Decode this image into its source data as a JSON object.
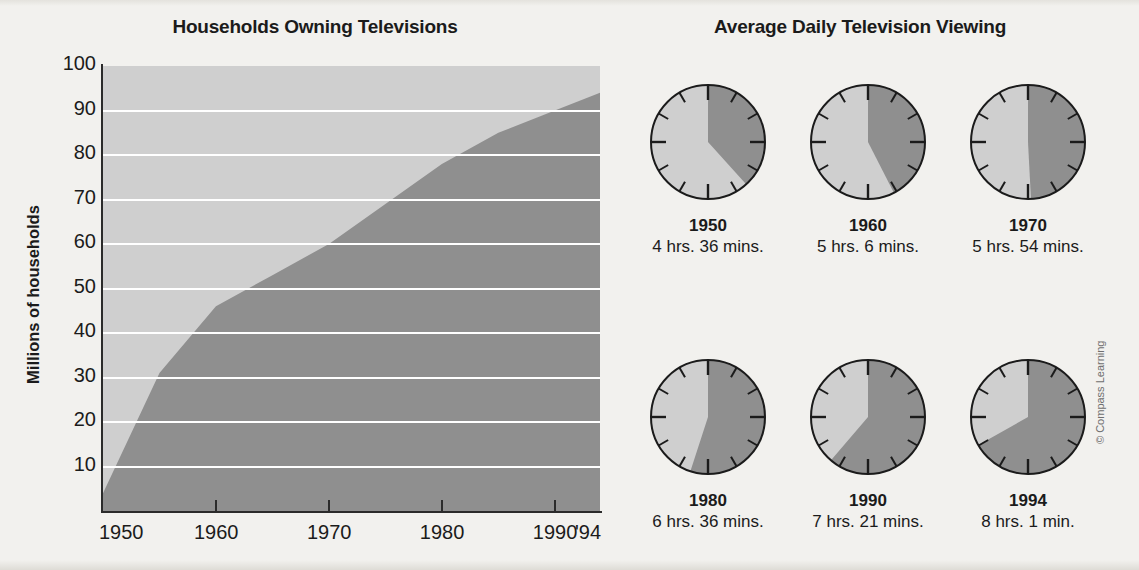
{
  "page": {
    "background_color": "#f2f1ee",
    "credit": "© Compass Learning"
  },
  "chart_panel": {
    "title": "Households Owning Televisions",
    "y_axis_label": "Millions of households"
  },
  "clocks_panel": {
    "title": "Average Daily Television Viewing",
    "clocks": [
      {
        "year": "1950",
        "duration": "4 hrs. 36 mins.",
        "hours": 4.6
      },
      {
        "year": "1960",
        "duration": "5 hrs. 6 mins.",
        "hours": 5.1
      },
      {
        "year": "1970",
        "duration": "5 hrs. 54 mins.",
        "hours": 5.9
      },
      {
        "year": "1980",
        "duration": "6 hrs. 36 mins.",
        "hours": 6.6
      },
      {
        "year": "1990",
        "duration": "7 hrs. 21 mins.",
        "hours": 7.35
      },
      {
        "year": "1994",
        "duration": "8 hrs. 1 min.",
        "hours": 8.017
      }
    ]
  },
  "chart_data": {
    "type": "area",
    "title": "Households Owning Televisions",
    "xlabel": "",
    "ylabel": "Millions of households",
    "x": [
      1950,
      1955,
      1960,
      1965,
      1970,
      1975,
      1980,
      1985,
      1990,
      1994
    ],
    "values": [
      4,
      31,
      46,
      53,
      60,
      69,
      78,
      85,
      90,
      94
    ],
    "xlim": [
      1950,
      1994
    ],
    "ylim": [
      0,
      100
    ],
    "xticks": [
      1950,
      1960,
      1970,
      1980,
      1990,
      1994
    ],
    "xtick_labels": [
      "1950",
      "1960",
      "1970",
      "1980",
      "1990",
      "'94"
    ],
    "yticks": [
      10,
      20,
      30,
      40,
      50,
      60,
      70,
      80,
      90,
      100
    ],
    "ytick_labels": [
      "10",
      "20",
      "30",
      "40",
      "50",
      "60",
      "70",
      "80",
      "90",
      "100"
    ],
    "grid": true,
    "legend": "none",
    "area_color": "#8f8f8f",
    "plot_background_color": "#cfcfcf",
    "gridline_color": "#ffffff"
  },
  "colors": {
    "fill_dark": "#8f8f8f",
    "fill_light": "#cfcfcf",
    "outline": "#2b2b2b",
    "text": "#1b1b1b"
  }
}
